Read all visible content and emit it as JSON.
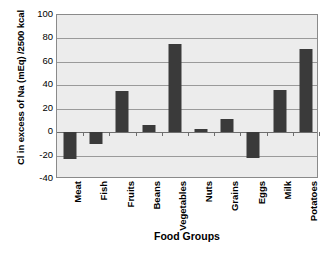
{
  "chart_data": {
    "type": "bar",
    "title": "",
    "xlabel": "Food Groups",
    "ylabel": "Cl in excess of Na (mEq) /2500 kcal",
    "categories": [
      "Meat",
      "Fish",
      "Fruits",
      "Beans",
      "Vegetables",
      "Nuts",
      "Grains",
      "Eggs",
      "Milk",
      "Potatoes"
    ],
    "values": [
      -23,
      -10,
      35,
      6,
      75,
      3,
      11,
      -22,
      36,
      71
    ],
    "ylim": [
      -40,
      100
    ],
    "ytick_labels": [
      "100",
      "80",
      "60",
      "40",
      "20",
      "0",
      "-20",
      "-40"
    ],
    "ytick_values": [
      100,
      80,
      60,
      40,
      20,
      0,
      -20,
      -40
    ],
    "grid": true,
    "legend": false,
    "bar_color": "#3a3a3a",
    "plot_background": "#ececec",
    "gridline_color": "#9a9a9a"
  },
  "caption": {
    "text": ""
  }
}
